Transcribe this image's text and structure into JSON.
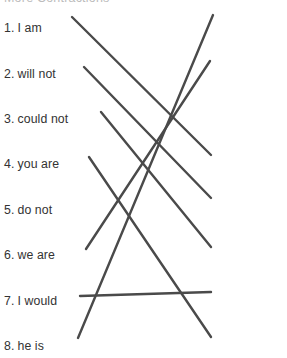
{
  "worksheet": {
    "title": "More Contractions",
    "title_visible": "partially cut off at top edge",
    "instruction_color": "#bcbcbc",
    "line_color": "#4a4a4a",
    "text_color": "#333333",
    "background_color": "#ffffff"
  },
  "left_column": {
    "name": "full-forms-column",
    "items": [
      {
        "num": "1.",
        "label": "I am",
        "x": 4,
        "y": 22
      },
      {
        "num": "2.",
        "label": "will not",
        "x": 4,
        "y": 68
      },
      {
        "num": "3.",
        "label": "could not",
        "x": 4,
        "y": 113
      },
      {
        "num": "4.",
        "label": "you are",
        "x": 4,
        "y": 158
      },
      {
        "num": "5.",
        "label": "do not",
        "x": 4,
        "y": 204
      },
      {
        "num": "6.",
        "label": "we are",
        "x": 4,
        "y": 249
      },
      {
        "num": "7.",
        "label": "I would",
        "x": 4,
        "y": 295
      },
      {
        "num": "8.",
        "label": "he is",
        "x": 4,
        "y": 340
      }
    ]
  },
  "right_column": {
    "name": "contractions-column",
    "items": [
      {
        "num": "A.",
        "label": "we’re",
        "x": 214,
        "y": 18
      },
      {
        "num": "B.",
        "label": "he’s",
        "x": 214,
        "y": 66
      },
      {
        "num": "C.",
        "label": "don’t",
        "x": 219,
        "y": 112
      },
      {
        "num": "D.",
        "label": "won’t",
        "x": 216,
        "y": 158
      },
      {
        "num": "E.",
        "label": "couldn’t",
        "x": 216,
        "y": 201
      },
      {
        "num": "F.",
        "label": "I’d",
        "x": 216,
        "y": 249
      },
      {
        "num": "G.",
        "label": "you’re",
        "x": 216,
        "y": 295
      },
      {
        "num": "H.",
        "label": "I’m",
        "x": 216,
        "y": 340
      }
    ]
  },
  "connections": [
    {
      "name": "line-1-to-D",
      "from": "1. I am",
      "to": "D. won’t",
      "x1": 72,
      "y1": 17,
      "x2": 211,
      "y2": 155
    },
    {
      "name": "line-2-to-E",
      "from": "2. will not",
      "to": "E. couldn’t",
      "x1": 84,
      "y1": 67,
      "x2": 211,
      "y2": 198
    },
    {
      "name": "line-3-to-F",
      "from": "3. could not",
      "to": "F. I’d",
      "x1": 101,
      "y1": 112,
      "x2": 211,
      "y2": 247
    },
    {
      "name": "line-4-to-H",
      "from": "4. you are",
      "to": "H. I’m",
      "x1": 89,
      "y1": 157,
      "x2": 211,
      "y2": 337
    },
    {
      "name": "line-6-to-B",
      "from": "6. we are",
      "to": "B. he’s",
      "x1": 86,
      "y1": 249,
      "x2": 210,
      "y2": 61
    },
    {
      "name": "line-7-to-G",
      "from": "7. I would",
      "to": "G. you’re",
      "x1": 80,
      "y1": 296,
      "x2": 211,
      "y2": 292
    },
    {
      "name": "line-8-to-A",
      "from": "8. he is",
      "to": "A. we’re",
      "x1": 78,
      "y1": 338,
      "x2": 213,
      "y2": 15
    }
  ]
}
